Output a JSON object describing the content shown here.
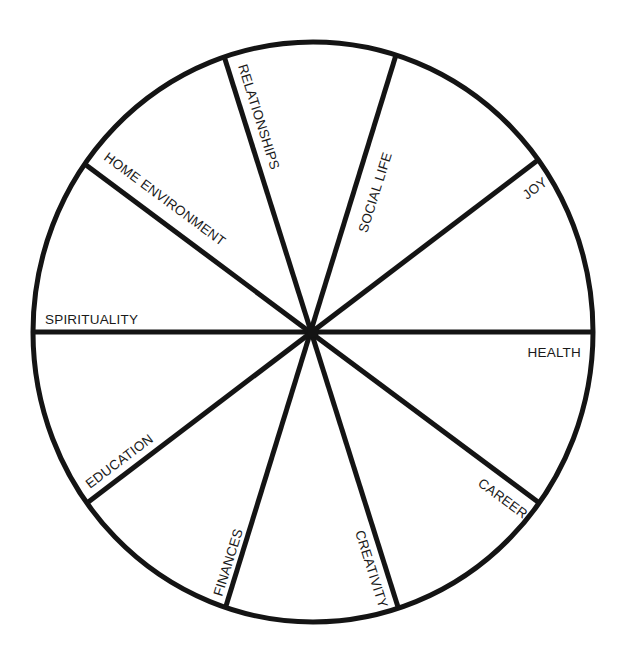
{
  "diagram": {
    "type": "wheel-of-life",
    "colors": {
      "line": "#141414",
      "background": "#ffffff",
      "text": "#1a1a1a"
    },
    "segments": [
      {
        "id": "relationships",
        "label": "RELATIONSHIPS"
      },
      {
        "id": "social-life",
        "label": "SOCIAL LIFE"
      },
      {
        "id": "joy",
        "label": "JOY"
      },
      {
        "id": "health",
        "label": "HEALTH"
      },
      {
        "id": "career",
        "label": "CAREER"
      },
      {
        "id": "creativity",
        "label": "CREATIVITY"
      },
      {
        "id": "finances",
        "label": "FINANCES"
      },
      {
        "id": "education",
        "label": "EDUCATION"
      },
      {
        "id": "spirituality",
        "label": "SPIRITUALITY"
      },
      {
        "id": "home-environment",
        "label": "HOME ENVIRONMENT"
      }
    ]
  }
}
